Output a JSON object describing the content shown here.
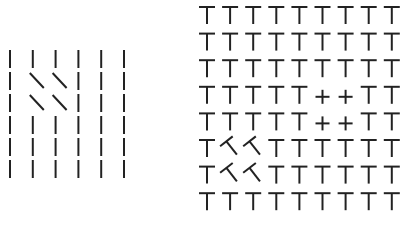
{
  "figure": {
    "stroke_color": "#222222",
    "background": "#ffffff",
    "left_panel": {
      "description": "Texture segregation: vertical lines with a 2x2 patch of diagonal lines",
      "rows": 6,
      "cols": 6,
      "origin": [
        10,
        50
      ],
      "col_pitch": 22.8,
      "row_pitch": 22,
      "element_length": 18,
      "default_element": "vertical",
      "odd_elements": [
        {
          "row": 1,
          "col": 1,
          "type": "diagonal"
        },
        {
          "row": 1,
          "col": 2,
          "type": "diagonal"
        },
        {
          "row": 2,
          "col": 1,
          "type": "diagonal"
        },
        {
          "row": 2,
          "col": 2,
          "type": "diagonal"
        }
      ]
    },
    "right_panel": {
      "description": "Texture segregation: grid of T shapes with a 2x2 patch of crosses and a 2x2 patch of tilted Ts",
      "rows": 8,
      "cols": 9,
      "origin": [
        207,
        7
      ],
      "col_pitch": 23.1,
      "row_pitch": 26.6,
      "bar_width": 16,
      "stem_length": 17,
      "default_element": "T",
      "odd_elements": [
        {
          "row": 3,
          "col": 5,
          "type": "plus"
        },
        {
          "row": 3,
          "col": 6,
          "type": "plus"
        },
        {
          "row": 4,
          "col": 5,
          "type": "plus"
        },
        {
          "row": 4,
          "col": 6,
          "type": "plus"
        },
        {
          "row": 5,
          "col": 1,
          "type": "tilted-T"
        },
        {
          "row": 5,
          "col": 2,
          "type": "tilted-T"
        },
        {
          "row": 6,
          "col": 1,
          "type": "tilted-T"
        },
        {
          "row": 6,
          "col": 2,
          "type": "tilted-T"
        }
      ]
    }
  }
}
